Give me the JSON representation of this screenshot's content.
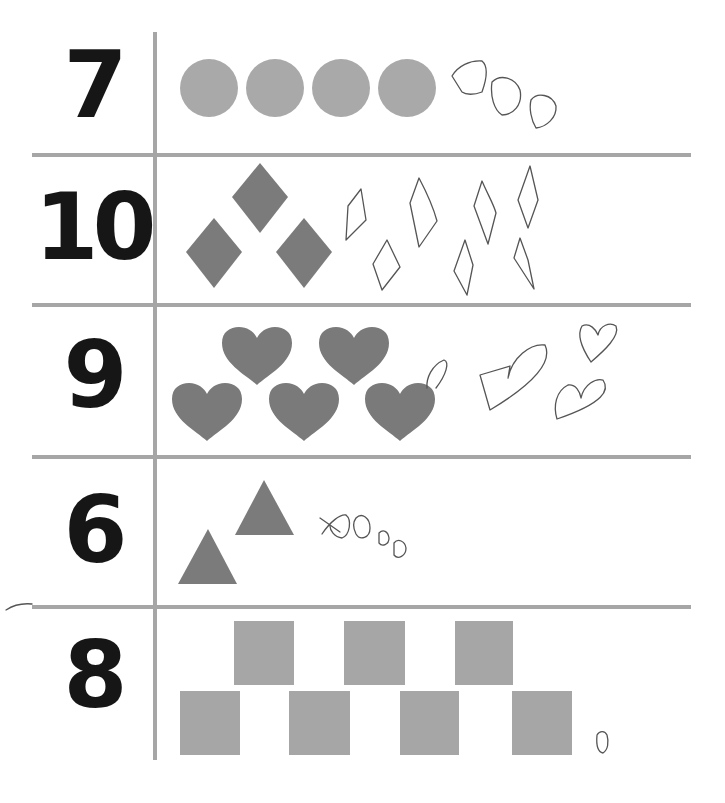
{
  "worksheet": {
    "rows": [
      {
        "number": "7",
        "shape": "circle",
        "printed_count": 4,
        "drawn_count": 3,
        "fill": "#a9a9a9"
      },
      {
        "number": "10",
        "shape": "diamond",
        "printed_count": 3,
        "drawn_count": 7,
        "fill": "#7b7b7b"
      },
      {
        "number": "9",
        "shape": "heart",
        "printed_count": 5,
        "drawn_count": 4,
        "fill": "#7a7a7a"
      },
      {
        "number": "6",
        "shape": "triangle",
        "printed_count": 2,
        "drawn_count": 4,
        "fill": "#7b7b7b"
      },
      {
        "number": "8",
        "shape": "square",
        "printed_count": 7,
        "drawn_count": 1,
        "fill": "#a6a6a6"
      }
    ],
    "grid_color": "#a6a6a6",
    "number_color": "#161616",
    "pencil_color": "#555555"
  }
}
